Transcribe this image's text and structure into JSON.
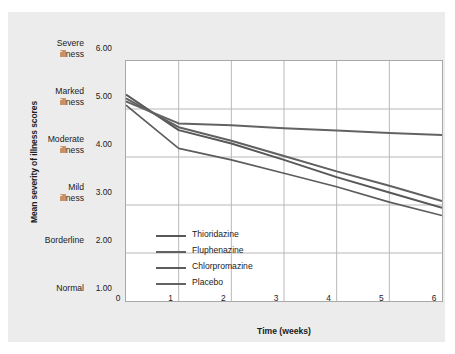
{
  "figure": {
    "panel_bg": "#ececec",
    "plot_bg": "#ffffff",
    "frame_color": "#a9a9a9",
    "grid_color": "#b8b8b8",
    "text_color": "#1b1b1b"
  },
  "chart_data": {
    "type": "line",
    "title": "",
    "xlabel": "Time (weeks)",
    "ylabel": "Mean severity of illness scores",
    "x": [
      0,
      1,
      2,
      3,
      4,
      5,
      6
    ],
    "xlim": [
      0,
      6
    ],
    "ylim": [
      1.0,
      6.0
    ],
    "xticks": [
      "0",
      "1",
      "2",
      "3",
      "4",
      "5",
      "6"
    ],
    "yticks": [
      "1.00",
      "2.00",
      "3.00",
      "4.00",
      "5.00",
      "6.00"
    ],
    "ytick_values": [
      1.0,
      2.0,
      3.0,
      4.0,
      5.0,
      6.0
    ],
    "ycategories": [
      {
        "label_line1": "Severe",
        "label_line2": "illness",
        "value": 6.0
      },
      {
        "label_line1": "Marked",
        "label_line2": "illness",
        "value": 5.0
      },
      {
        "label_line1": "Moderate",
        "label_line2": "illness",
        "value": 4.0
      },
      {
        "label_line1": "Mild",
        "label_line2": "illness",
        "value": 3.0
      },
      {
        "label_line1": "Borderline",
        "label_line2": "",
        "value": 2.0
      },
      {
        "label_line1": "Normal",
        "label_line2": "",
        "value": 1.0
      }
    ],
    "grid": true,
    "legend_position": "inside-lower-left",
    "series": [
      {
        "name": "Thioridazine",
        "color": "#585858",
        "width": 2.0,
        "values": [
          5.3,
          4.56,
          4.28,
          3.94,
          3.58,
          3.26,
          2.94
        ]
      },
      {
        "name": "Fluphenazine",
        "color": "#616161",
        "width": 2.0,
        "values": [
          5.22,
          4.62,
          4.34,
          4.02,
          3.7,
          3.4,
          3.08
        ]
      },
      {
        "name": "Chlorpromazine",
        "color": "#5c5c5c",
        "width": 1.6,
        "values": [
          5.08,
          4.18,
          3.94,
          3.66,
          3.38,
          3.06,
          2.78
        ]
      },
      {
        "name": "Placebo",
        "color": "#636363",
        "width": 2.0,
        "values": [
          5.16,
          4.7,
          4.66,
          4.6,
          4.55,
          4.5,
          4.46
        ]
      }
    ]
  }
}
